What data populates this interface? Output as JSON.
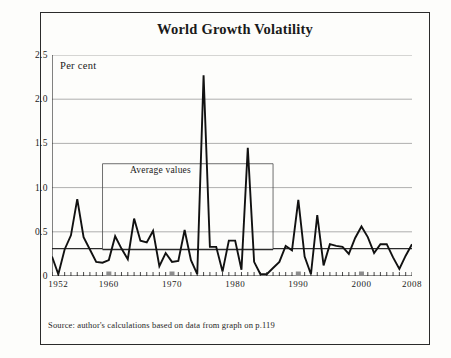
{
  "figure": {
    "title": "World Growth Volatility",
    "unit_label": "Per cent",
    "annotation_label": "Average values",
    "source_note": "Source:  author's calculations based on data from graph on p.119",
    "border_color": "#2b2b2b",
    "series_color": "#111111",
    "grid_color": "#9a9a9a",
    "average_line_color": "#2b2b2b",
    "emphasis_tick_color": "#8c8c8c"
  },
  "chart_data": {
    "type": "line",
    "title": "World Growth Volatility",
    "xlabel": "",
    "ylabel": "Per cent",
    "ylim": [
      0,
      2.5
    ],
    "xlim": [
      1951,
      2008
    ],
    "grid": true,
    "legend": "none",
    "y_ticks": [
      "0",
      "0.5",
      "1.0",
      "1.5",
      "2.0",
      "2.5"
    ],
    "y_tick_values": [
      0,
      0.5,
      1.0,
      1.5,
      2.0,
      2.5
    ],
    "x_ticks": [
      "1952",
      "1960",
      "1970",
      "1980",
      "1990",
      "2000",
      "2008"
    ],
    "x_tick_values": [
      1952,
      1960,
      1970,
      1980,
      1990,
      2000,
      2008
    ],
    "emphasis_ticks": [
      1960,
      1970,
      1990,
      2000
    ],
    "annotations": [
      {
        "text": "Average values",
        "x": 1969,
        "y": 1.27
      }
    ],
    "series": [
      {
        "name": "World growth volatility",
        "x": [
          1951,
          1952,
          1953,
          1954,
          1955,
          1956,
          1957,
          1958,
          1959,
          1960,
          1961,
          1962,
          1963,
          1964,
          1965,
          1966,
          1967,
          1968,
          1969,
          1970,
          1971,
          1972,
          1973,
          1974,
          1975,
          1976,
          1977,
          1978,
          1979,
          1980,
          1981,
          1982,
          1983,
          1984,
          1985,
          1986,
          1987,
          1988,
          1989,
          1990,
          1991,
          1992,
          1993,
          1994,
          1995,
          1996,
          1997,
          1998,
          1999,
          2000,
          2001,
          2002,
          2003,
          2004,
          2005,
          2006,
          2007,
          2008
        ],
        "values": [
          0.22,
          0.02,
          0.3,
          0.46,
          0.87,
          0.44,
          0.3,
          0.16,
          0.15,
          0.18,
          0.45,
          0.31,
          0.19,
          0.65,
          0.4,
          0.38,
          0.51,
          0.11,
          0.26,
          0.16,
          0.17,
          0.52,
          0.18,
          0.02,
          2.27,
          0.33,
          0.33,
          0.05,
          0.4,
          0.4,
          0.07,
          1.45,
          0.16,
          0.02,
          0.02,
          0.09,
          0.16,
          0.34,
          0.29,
          0.86,
          0.22,
          0.02,
          0.69,
          0.12,
          0.36,
          0.34,
          0.33,
          0.25,
          0.43,
          0.56,
          0.44,
          0.26,
          0.36,
          0.36,
          0.21,
          0.08,
          0.23,
          0.36
        ]
      },
      {
        "name": "Average values (period means)",
        "type": "step",
        "segments": [
          {
            "x_start": 1951,
            "x_end": 1959,
            "value": 0.31
          },
          {
            "x_start": 1959,
            "x_end": 1986,
            "value": 0.3
          },
          {
            "x_start": 1986,
            "x_end": 2008,
            "value": 0.31
          }
        ]
      },
      {
        "name": "Annotation bracket",
        "type": "bracket",
        "level": 1.27,
        "x_start": 1959,
        "x_end": 1986
      }
    ]
  }
}
